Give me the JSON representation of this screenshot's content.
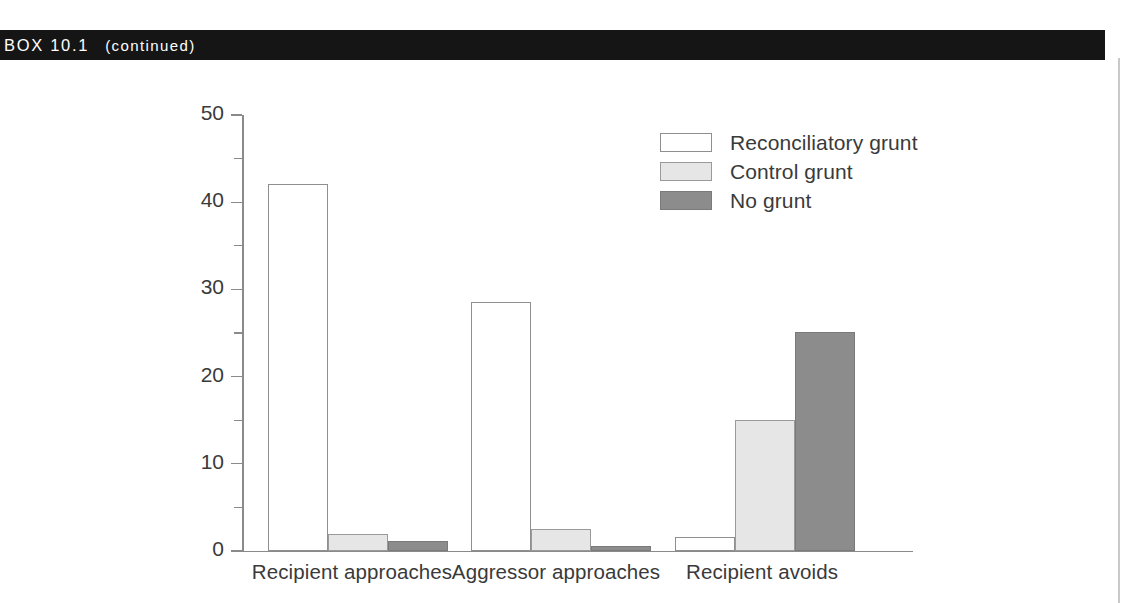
{
  "header": {
    "box_label": "BOX 10.1",
    "continued_label": "(continued)"
  },
  "chart_data": {
    "type": "bar",
    "title": "",
    "subtitle": "",
    "xlabel": "",
    "ylabel": "Percentage of post-conflict samples",
    "ylim": [
      0,
      50
    ],
    "yticks": [
      0,
      10,
      20,
      30,
      40,
      50
    ],
    "ytick_labels": [
      "0",
      "10",
      "20",
      "30",
      "40",
      "50"
    ],
    "yminor_ticks": [
      5,
      15,
      25,
      35,
      45
    ],
    "grid": false,
    "legend_position": "upper right",
    "categories": [
      "Recipient approaches",
      "Aggressor approaches",
      "Recipient avoids"
    ],
    "series": [
      {
        "name": "Reconciliatory grunt",
        "color": "#ffffff",
        "edge_color": "#8f8f8f",
        "values": [
          42.1,
          28.6,
          1.6
        ]
      },
      {
        "name": "Control grunt",
        "color": "#e6e6e6",
        "edge_color": "#9a9a9a",
        "values": [
          2.0,
          2.5,
          15.0
        ]
      },
      {
        "name": "No grunt",
        "color": "#8c8c8c",
        "edge_color": "#7a7a7a",
        "values": [
          1.2,
          0.6,
          25.1
        ]
      }
    ]
  },
  "colors": {
    "band_background": "#151515",
    "band_text": "#ffffff",
    "axis": "#8a8a8a",
    "text": "#3a3a3a",
    "page_background": "#ffffff"
  }
}
